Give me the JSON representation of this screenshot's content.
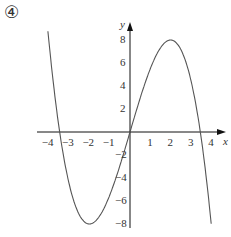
{
  "problem_label": "④",
  "chart_data": {
    "type": "line",
    "title": "",
    "xlabel": "x",
    "ylabel": "y",
    "function": "y = 6x - x^3/2",
    "x_ticks": [
      -4,
      -3,
      -2,
      -1,
      1,
      2,
      3,
      4
    ],
    "y_ticks": [
      8,
      6,
      4,
      2,
      -2,
      -4,
      -6,
      -8
    ],
    "xlim": [
      -4.6,
      4.9
    ],
    "ylim": [
      -9.2,
      9.5
    ],
    "grid": false,
    "series": [
      {
        "name": "curve",
        "x": [
          -4.3,
          -4,
          -3.46,
          -3,
          -2,
          -1,
          0,
          1,
          2,
          3,
          3.46,
          4,
          4.3
        ],
        "y": [
          9.9,
          8,
          0,
          -4.5,
          -8,
          -5.5,
          0,
          5.5,
          8,
          4.5,
          0,
          -8,
          -9.9
        ]
      }
    ],
    "extrema": [
      {
        "x": -2,
        "y": -8,
        "type": "min"
      },
      {
        "x": 2,
        "y": 8,
        "type": "max"
      }
    ],
    "roots": [
      -3.46,
      0,
      3.46
    ],
    "colors": {
      "axis": "#111111",
      "curve": "#555555",
      "text": "#333333"
    }
  }
}
